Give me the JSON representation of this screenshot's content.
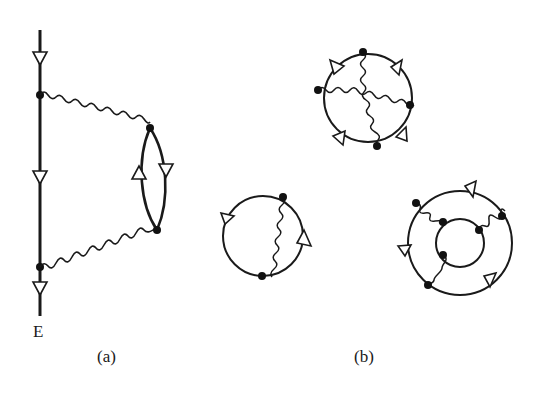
{
  "figure": {
    "panels": [
      {
        "id": "a",
        "label": "(a)",
        "description": "Fermion line with second-order polarization bubble",
        "endpoint_label": "E"
      },
      {
        "id": "b",
        "label": "(b)",
        "description": "Closed vacuum diagrams with photon exchange"
      }
    ],
    "colors": {
      "ink": "#1a1a1a",
      "background": "#ffffff"
    }
  }
}
